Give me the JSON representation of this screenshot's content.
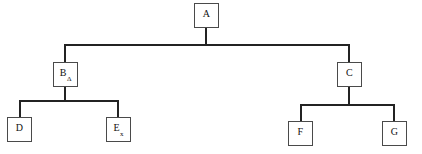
{
  "diagram": {
    "type": "tree",
    "node_border_color": "#4a4a4a",
    "edge_color": "#232323",
    "background_color": "#ffffff",
    "nodes": [
      {
        "id": "A",
        "label": "A",
        "sub": "",
        "level": 0,
        "x": 194,
        "y": 3,
        "parent": null
      },
      {
        "id": "B",
        "label": "B",
        "sub": "Δ",
        "level": 1,
        "x": 53,
        "y": 62,
        "parent": "A"
      },
      {
        "id": "C",
        "label": "C",
        "sub": "",
        "level": 1,
        "x": 337,
        "y": 62,
        "parent": "A"
      },
      {
        "id": "D",
        "label": "D",
        "sub": "",
        "level": 2,
        "x": 7,
        "y": 117,
        "parent": "B"
      },
      {
        "id": "E",
        "label": "E",
        "sub": "x",
        "level": 2,
        "x": 106,
        "y": 117,
        "parent": "B"
      },
      {
        "id": "F",
        "label": "F",
        "sub": "",
        "level": 2,
        "x": 288,
        "y": 121,
        "parent": "C"
      },
      {
        "id": "G",
        "label": "G",
        "sub": "",
        "level": 2,
        "x": 382,
        "y": 121,
        "parent": "C"
      }
    ],
    "edges": [
      {
        "from": "A",
        "to": "bus-1",
        "kind": "vertical"
      },
      {
        "from": "bus-1",
        "to": "B",
        "kind": "horizontal"
      },
      {
        "from": "bus-1",
        "to": "C",
        "kind": "horizontal"
      },
      {
        "from": "B",
        "to": "bus-2",
        "kind": "vertical"
      },
      {
        "from": "bus-2",
        "to": "D",
        "kind": "horizontal"
      },
      {
        "from": "bus-2",
        "to": "E",
        "kind": "horizontal"
      },
      {
        "from": "C",
        "to": "bus-3",
        "kind": "vertical"
      },
      {
        "from": "bus-3",
        "to": "F",
        "kind": "horizontal"
      },
      {
        "from": "bus-3",
        "to": "G",
        "kind": "horizontal"
      }
    ]
  }
}
